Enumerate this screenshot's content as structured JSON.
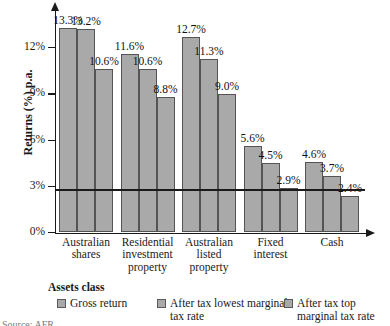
{
  "chart_data": {
    "type": "bar",
    "title": "",
    "xlabel": "Assets class",
    "ylabel": "Returns (%) p.a.",
    "categories": [
      "Australian shares",
      "Residential investment property",
      "Australian listed property",
      "Fixed interest",
      "Cash"
    ],
    "category_lines": [
      [
        "Australian",
        "shares"
      ],
      [
        "Residential",
        "investment",
        "property"
      ],
      [
        "Australian",
        "listed",
        "property"
      ],
      [
        "Fixed",
        "interest"
      ],
      [
        "Cash"
      ]
    ],
    "series": [
      {
        "name": "Gross return",
        "values": [
          13.3,
          11.6,
          12.7,
          5.6,
          4.6
        ],
        "labels": [
          "13.3%",
          "11.6%",
          "12.7%",
          "5.6%",
          "4.6%"
        ]
      },
      {
        "name": "After tax lowest marginal tax rate",
        "values": [
          13.2,
          10.6,
          11.3,
          4.5,
          3.7
        ],
        "labels": [
          "13.2%",
          "10.6%",
          "11.3%",
          "4.5%",
          "3.7%"
        ]
      },
      {
        "name": "After tax top marginal tax rate",
        "values": [
          10.6,
          8.8,
          9.0,
          2.9,
          2.4
        ],
        "labels": [
          "10.6%",
          "8.8%",
          "9.0%",
          "2.9%",
          "2.4%"
        ]
      }
    ],
    "ylim": [
      0,
      14.45
    ],
    "yticks": [
      0,
      3,
      6,
      9,
      12
    ],
    "ytick_labels": [
      "0%",
      "3%",
      "6%",
      "9%",
      "12%"
    ],
    "grid": false,
    "reference_line": {
      "value": 2.8,
      "label": ""
    },
    "bar_color": "#a9a9a9",
    "bar_edge_color": "#545454",
    "axis_color": "#1a1a1a",
    "legend_position": "bottom"
  },
  "legend": {
    "title": "Assets class",
    "entries": [
      {
        "label_lines": [
          "Gross return"
        ]
      },
      {
        "label_lines": [
          "After tax lowest marginal",
          "tax rate"
        ]
      },
      {
        "label_lines": [
          "After tax top",
          "marginal tax rate"
        ]
      }
    ]
  },
  "caption": {
    "clipped_text": "Source: AFR"
  }
}
